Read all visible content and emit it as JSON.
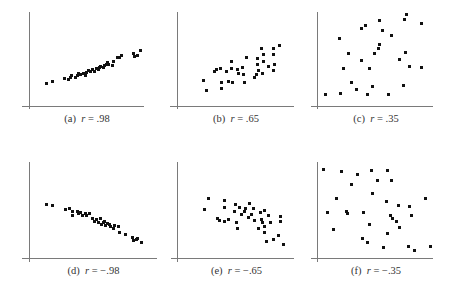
{
  "figure": {
    "panels": [
      {
        "id": "a",
        "caption_tag": "(a)",
        "caption_r": "r",
        "caption_eq": " = .98"
      },
      {
        "id": "b",
        "caption_tag": "(b)",
        "caption_r": "r",
        "caption_eq": " = .65"
      },
      {
        "id": "c",
        "caption_tag": "(c)",
        "caption_r": "r",
        "caption_eq": " = .35"
      },
      {
        "id": "d",
        "caption_tag": "(d)",
        "caption_r": "r",
        "caption_eq": " = −.98"
      },
      {
        "id": "e",
        "caption_tag": "(e)",
        "caption_r": "r",
        "caption_eq": " = −.65"
      },
      {
        "id": "f",
        "caption_tag": "(f)",
        "caption_r": "r",
        "caption_eq": " = −.35"
      }
    ]
  },
  "chart_data": [
    {
      "type": "scatter",
      "title": "(a) r = .98",
      "correlation": 0.98,
      "grid": false,
      "xlabel": "",
      "ylabel": "",
      "layout": {
        "yaxis_x": 29,
        "yaxis_top": 12,
        "yaxis_bottom": 109,
        "xaxis_y": 106,
        "xaxis_left": 22,
        "xaxis_right": 144
      },
      "points": [
        [
          46,
          83
        ],
        [
          52,
          81
        ],
        [
          64,
          78
        ],
        [
          68,
          79
        ],
        [
          70,
          77
        ],
        [
          71,
          75
        ],
        [
          75,
          77
        ],
        [
          77,
          75
        ],
        [
          78,
          73
        ],
        [
          80,
          74
        ],
        [
          83,
          73
        ],
        [
          85,
          75
        ],
        [
          86,
          72
        ],
        [
          88,
          70
        ],
        [
          90,
          71
        ],
        [
          92,
          69
        ],
        [
          94,
          71
        ],
        [
          96,
          68
        ],
        [
          98,
          69
        ],
        [
          99,
          67
        ],
        [
          100,
          66
        ],
        [
          103,
          67
        ],
        [
          104,
          65
        ],
        [
          106,
          64
        ],
        [
          107,
          62
        ],
        [
          108,
          64
        ],
        [
          112,
          65
        ],
        [
          113,
          61
        ],
        [
          117,
          57
        ],
        [
          119,
          57
        ],
        [
          121,
          55
        ],
        [
          133,
          53
        ],
        [
          134,
          56
        ],
        [
          137,
          55
        ],
        [
          140,
          50
        ]
      ]
    },
    {
      "type": "scatter",
      "title": "(b) r = .65",
      "correlation": 0.65,
      "grid": false,
      "xlabel": "",
      "ylabel": "",
      "layout": {
        "yaxis_x": 177,
        "yaxis_top": 12,
        "yaxis_bottom": 109,
        "xaxis_y": 106,
        "xaxis_left": 170,
        "xaxis_right": 294
      },
      "points": [
        [
          203,
          80
        ],
        [
          206,
          90
        ],
        [
          214,
          71
        ],
        [
          216,
          69
        ],
        [
          220,
          68
        ],
        [
          221,
          82
        ],
        [
          221,
          88
        ],
        [
          226,
          71
        ],
        [
          231,
          61
        ],
        [
          231,
          68
        ],
        [
          228,
          81
        ],
        [
          232,
          82
        ],
        [
          237,
          69
        ],
        [
          238,
          73
        ],
        [
          242,
          67
        ],
        [
          243,
          74
        ],
        [
          244,
          82
        ],
        [
          246,
          57
        ],
        [
          254,
          77
        ],
        [
          256,
          74
        ],
        [
          257,
          58
        ],
        [
          257,
          64
        ],
        [
          258,
          70
        ],
        [
          261,
          48
        ],
        [
          263,
          61
        ],
        [
          263,
          54
        ],
        [
          262,
          73
        ],
        [
          268,
          66
        ],
        [
          273,
          70
        ],
        [
          273,
          48
        ],
        [
          274,
          64
        ],
        [
          279,
          45
        ],
        [
          273,
          54
        ]
      ]
    },
    {
      "type": "scatter",
      "title": "(c) r = .35",
      "correlation": 0.35,
      "grid": false,
      "xlabel": "",
      "ylabel": "",
      "layout": {
        "yaxis_x": 317,
        "yaxis_top": 12,
        "yaxis_bottom": 109,
        "xaxis_y": 106,
        "xaxis_left": 311,
        "xaxis_right": 433
      },
      "points": [
        [
          325,
          94
        ],
        [
          340,
          93
        ],
        [
          351,
          82
        ],
        [
          356,
          89
        ],
        [
          361,
          60
        ],
        [
          369,
          68
        ],
        [
          374,
          53
        ],
        [
          339,
          38
        ],
        [
          348,
          53
        ],
        [
          343,
          68
        ],
        [
          361,
          28
        ],
        [
          365,
          25
        ],
        [
          367,
          94
        ],
        [
          379,
          20
        ],
        [
          372,
          86
        ],
        [
          378,
          48
        ],
        [
          379,
          44
        ],
        [
          382,
          30
        ],
        [
          388,
          94
        ],
        [
          391,
          35
        ],
        [
          399,
          59
        ],
        [
          404,
          19
        ],
        [
          406,
          14
        ],
        [
          403,
          85
        ],
        [
          405,
          52
        ],
        [
          409,
          66
        ],
        [
          421,
          67
        ],
        [
          421,
          23
        ]
      ]
    },
    {
      "type": "scatter",
      "title": "(d) r = −.98",
      "correlation": -0.98,
      "grid": false,
      "xlabel": "",
      "ylabel": "",
      "layout": {
        "yaxis_x": 29,
        "yaxis_top": 162,
        "yaxis_bottom": 262,
        "xaxis_y": 258,
        "xaxis_left": 22,
        "xaxis_right": 157
      },
      "points": [
        [
          46,
          204
        ],
        [
          52,
          205
        ],
        [
          65,
          209
        ],
        [
          69,
          208
        ],
        [
          72,
          211
        ],
        [
          72,
          215
        ],
        [
          77,
          211
        ],
        [
          78,
          213
        ],
        [
          80,
          212
        ],
        [
          82,
          215
        ],
        [
          85,
          213
        ],
        [
          86,
          215
        ],
        [
          89,
          213
        ],
        [
          92,
          218
        ],
        [
          94,
          221
        ],
        [
          96,
          219
        ],
        [
          98,
          222
        ],
        [
          100,
          218
        ],
        [
          101,
          224
        ],
        [
          103,
          222
        ],
        [
          104,
          221
        ],
        [
          105,
          225
        ],
        [
          107,
          223
        ],
        [
          109,
          224
        ],
        [
          110,
          226
        ],
        [
          113,
          228
        ],
        [
          114,
          225
        ],
        [
          118,
          226
        ],
        [
          119,
          232
        ],
        [
          125,
          234
        ],
        [
          132,
          237
        ],
        [
          133,
          240
        ],
        [
          136,
          239
        ],
        [
          137,
          238
        ],
        [
          141,
          242
        ]
      ]
    },
    {
      "type": "scatter",
      "title": "(e) r = −.65",
      "correlation": -0.65,
      "grid": false,
      "xlabel": "",
      "ylabel": "",
      "layout": {
        "yaxis_x": 177,
        "yaxis_top": 162,
        "yaxis_bottom": 262,
        "xaxis_y": 258,
        "xaxis_left": 171,
        "xaxis_right": 294
      },
      "points": [
        [
          204,
          209
        ],
        [
          208,
          198
        ],
        [
          217,
          218
        ],
        [
          219,
          220
        ],
        [
          224,
          200
        ],
        [
          224,
          207
        ],
        [
          224,
          221
        ],
        [
          228,
          219
        ],
        [
          234,
          211
        ],
        [
          235,
          204
        ],
        [
          236,
          222
        ],
        [
          237,
          228
        ],
        [
          239,
          207
        ],
        [
          241,
          214
        ],
        [
          244,
          211
        ],
        [
          245,
          208
        ],
        [
          248,
          217
        ],
        [
          249,
          203
        ],
        [
          251,
          214
        ],
        [
          253,
          208
        ],
        [
          254,
          220
        ],
        [
          258,
          228
        ],
        [
          260,
          212
        ],
        [
          261,
          219
        ],
        [
          262,
          222
        ],
        [
          264,
          210
        ],
        [
          264,
          226
        ],
        [
          264,
          232
        ],
        [
          266,
          241
        ],
        [
          268,
          215
        ],
        [
          270,
          222
        ],
        [
          273,
          239
        ],
        [
          278,
          235
        ],
        [
          280,
          216
        ],
        [
          280,
          221
        ],
        [
          283,
          244
        ]
      ]
    },
    {
      "type": "scatter",
      "title": "(f) r = −.35",
      "correlation": -0.35,
      "grid": false,
      "xlabel": "",
      "ylabel": "",
      "layout": {
        "yaxis_x": 317,
        "yaxis_top": 162,
        "yaxis_bottom": 262,
        "xaxis_y": 258,
        "xaxis_left": 311,
        "xaxis_right": 433
      },
      "points": [
        [
          323,
          169
        ],
        [
          341,
          171
        ],
        [
          351,
          184
        ],
        [
          357,
          174
        ],
        [
          371,
          170
        ],
        [
          387,
          170
        ],
        [
          377,
          180
        ],
        [
          391,
          180
        ],
        [
          336,
          198
        ],
        [
          372,
          193
        ],
        [
          386,
          201
        ],
        [
          398,
          205
        ],
        [
          409,
          206
        ],
        [
          347,
          213
        ],
        [
          327,
          212
        ],
        [
          346,
          211
        ],
        [
          363,
          212
        ],
        [
          390,
          215
        ],
        [
          392,
          218
        ],
        [
          396,
          221
        ],
        [
          411,
          215
        ],
        [
          333,
          229
        ],
        [
          369,
          224
        ],
        [
          387,
          233
        ],
        [
          399,
          227
        ],
        [
          362,
          238
        ],
        [
          367,
          242
        ],
        [
          383,
          247
        ],
        [
          408,
          246
        ],
        [
          414,
          250
        ],
        [
          430,
          246
        ],
        [
          425,
          198
        ]
      ]
    }
  ]
}
